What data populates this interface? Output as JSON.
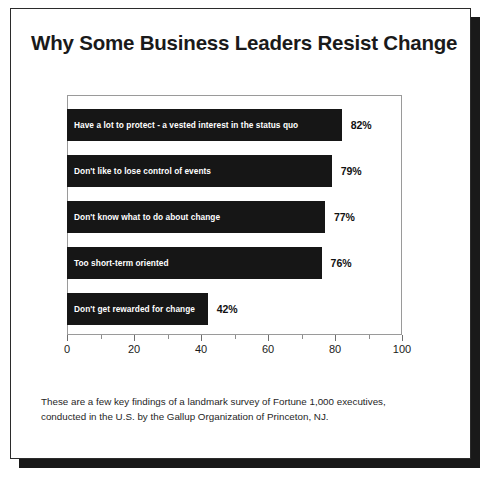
{
  "slide": {
    "title": "Why Some Business Leaders Resist Change",
    "footnote_line1": "These are a few key findings of a landmark survey of Fortune 1,000 executives,",
    "footnote_line2": "conducted in the U.S. by the Gallup Organization of Princeton, NJ.",
    "bottom_caption": ""
  },
  "colors": {
    "bar": "#161616",
    "bar_label_text": "#ffffff",
    "value_text": "#111111",
    "frame_border": "#9a9a9a",
    "slide_border": "#2b2b2b",
    "shadow": "#191919"
  },
  "chart_data": {
    "type": "bar",
    "orientation": "horizontal",
    "title": "Why Some Business Leaders Resist Change",
    "xlabel": "",
    "ylabel": "",
    "xlim": [
      0,
      100
    ],
    "grid": false,
    "legend": null,
    "tick_labels": [
      "0",
      "20",
      "40",
      "60",
      "80",
      "100"
    ],
    "tick_values": [
      0,
      20,
      40,
      60,
      80,
      100
    ],
    "minor_tick_values": [
      10,
      30,
      50,
      70,
      90
    ],
    "categories": [
      "Have a lot to protect - a vested interest in the status quo",
      "Don't like to lose control of events",
      "Don't know what to do about change",
      "Too short-term oriented",
      "Don't get rewarded for change"
    ],
    "values": [
      82,
      79,
      77,
      76,
      42
    ],
    "value_labels": [
      "82%",
      "79%",
      "77%",
      "76%",
      "42%"
    ]
  }
}
